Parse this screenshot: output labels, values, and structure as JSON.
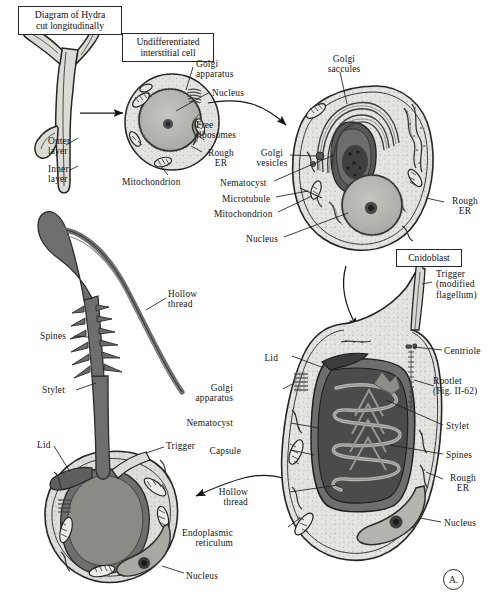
{
  "figure": {
    "panel_mark": "A.",
    "background": "#ffffff",
    "ink": "#1a1a1a"
  },
  "palette": {
    "cytoplasm": "#e3e3df",
    "cytoplasm_mid": "#d2d2cd",
    "nucleus": "#b9b9b4",
    "capsule_dark": "#4c4c4c",
    "capsule_mid": "#6f6f6f",
    "thread_gray": "#6e6e6e",
    "membrane": "#2b2b2b",
    "golgi": "#5a5a5a"
  },
  "boxed_titles": [
    {
      "id": "hydra-title",
      "text": "Diagram of Hydra\ncut longitudinally",
      "x": 18,
      "y": 6,
      "w": 94
    },
    {
      "id": "interstitial-title",
      "text": "Undifferentiated\ninterstitial cell",
      "x": 122,
      "y": 33,
      "w": 82
    },
    {
      "id": "cnidoblast-title",
      "text": "Cnidoblast",
      "x": 396,
      "y": 249,
      "w": 56
    }
  ],
  "hydra_labels": [
    {
      "id": "outer-layer",
      "text": "Outer\nlayer",
      "x": 48,
      "y": 136
    },
    {
      "id": "inner-layer",
      "text": "Inner\nlayer",
      "x": 48,
      "y": 164
    }
  ],
  "interstitial_labels": [
    {
      "id": "golgi-apparatus",
      "text": "Golgi\napparatus",
      "x": 196,
      "y": 59,
      "align": "left"
    },
    {
      "id": "nucleus",
      "text": "Nucleus",
      "x": 212,
      "y": 88,
      "align": "left"
    },
    {
      "id": "free-ribosomes",
      "text": "Free\nribosomes",
      "x": 196,
      "y": 120,
      "align": "left"
    },
    {
      "id": "rough-er",
      "text": "Rough\nER",
      "x": 204,
      "y": 148,
      "align": "left"
    },
    {
      "id": "mitochondrion",
      "text": "Mitochondrion",
      "x": 122,
      "y": 177,
      "align": "left"
    }
  ],
  "cnidoblast_dev_labels": [
    {
      "id": "golgi-saccules",
      "text": "Golgi\nsaccules",
      "x": 320,
      "y": 54,
      "align": "center"
    },
    {
      "id": "golgi-vesicles",
      "text": "Golgi\nvesicles",
      "x": 256,
      "y": 148,
      "align": "left"
    },
    {
      "id": "nematocyst",
      "text": "Nematocyst",
      "x": 220,
      "y": 178,
      "align": "left"
    },
    {
      "id": "microtubule",
      "text": "Microtubule",
      "x": 222,
      "y": 194,
      "align": "left"
    },
    {
      "id": "mitochondrion-2",
      "text": "Mitochondrion",
      "x": 214,
      "y": 209,
      "align": "left"
    },
    {
      "id": "nucleus-2",
      "text": "Nucleus",
      "x": 246,
      "y": 234,
      "align": "left"
    },
    {
      "id": "rough-er-2",
      "text": "Rough\nER",
      "x": 448,
      "y": 196,
      "align": "left"
    }
  ],
  "mature_cnidoblast_labels": [
    {
      "id": "trigger-flagellum",
      "text": "Trigger\n(modified\nflagellum)",
      "x": 436,
      "y": 269,
      "align": "left"
    },
    {
      "id": "centriole",
      "text": "Centriole",
      "x": 444,
      "y": 346,
      "align": "left"
    },
    {
      "id": "rootlet",
      "text": "Rootlet\n(Fig. II-62)",
      "x": 436,
      "y": 376,
      "align": "left"
    },
    {
      "id": "stylet-2",
      "text": "Stylet",
      "x": 446,
      "y": 421,
      "align": "left"
    },
    {
      "id": "spines-2",
      "text": "Spines",
      "x": 446,
      "y": 450,
      "align": "left"
    },
    {
      "id": "rough-er-3",
      "text": "Rough\nER",
      "x": 446,
      "y": 473,
      "align": "left"
    },
    {
      "id": "nucleus-3",
      "text": "Nucleus",
      "x": 444,
      "y": 518,
      "align": "left"
    },
    {
      "id": "lid-2",
      "text": "Lid",
      "x": 278,
      "y": 353,
      "align": "right"
    },
    {
      "id": "golgi-apparatus-2",
      "text": "Golgi\napparatus",
      "x": 233,
      "y": 383,
      "align": "right"
    },
    {
      "id": "nematocyst-2",
      "text": "Nematocyst",
      "x": 233,
      "y": 418,
      "align": "right"
    },
    {
      "id": "capsule",
      "text": "Capsule",
      "x": 241,
      "y": 446,
      "align": "right"
    },
    {
      "id": "hollow-thread-2",
      "text": "Hollow\nthread",
      "x": 248,
      "y": 487,
      "align": "right"
    },
    {
      "id": "endoplasmic-reticulum",
      "text": "Endoplasmic\nreticulum",
      "x": 233,
      "y": 528,
      "align": "right"
    }
  ],
  "discharged_labels": [
    {
      "id": "hollow-thread",
      "text": "Hollow\nthread",
      "x": 168,
      "y": 289,
      "align": "left"
    },
    {
      "id": "spines",
      "text": "Spines",
      "x": 40,
      "y": 331,
      "align": "left"
    },
    {
      "id": "stylet",
      "text": "Stylet",
      "x": 42,
      "y": 385,
      "align": "left"
    },
    {
      "id": "lid",
      "text": "Lid",
      "x": 37,
      "y": 440,
      "align": "left"
    },
    {
      "id": "trigger",
      "text": "Trigger",
      "x": 166,
      "y": 441,
      "align": "left"
    },
    {
      "id": "nucleus-4",
      "text": "Nucleus",
      "x": 186,
      "y": 571,
      "align": "left"
    }
  ],
  "structure_names": [
    "hydra-body-outline",
    "interstitial-cell",
    "developing-cnidoblast",
    "mature-cnidoblast",
    "discharged-nematocyst",
    "arrow-hydra-to-interstitial",
    "arrow-interstitial-to-cnidoblast",
    "arrow-cnidoblast-to-mature",
    "arrow-mature-to-discharged"
  ]
}
